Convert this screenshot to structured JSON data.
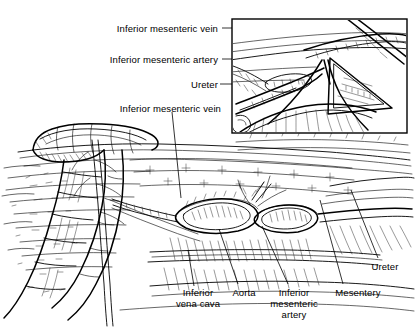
{
  "figure": {
    "style": "pen-and-ink line drawing",
    "background_color": "#ffffff",
    "ink_color": "#000000",
    "width": 416,
    "height": 335
  },
  "inset": {
    "name": "magnified-detail-panel",
    "caption": "",
    "frame_color": "#000000",
    "background_color": "#ffffff",
    "x": 232,
    "y": 19,
    "width": 175,
    "height": 114
  },
  "labels": {
    "inset_group": [
      {
        "id": "inset-imv",
        "text": "Inferior mesenteric vein",
        "x": 218,
        "y": 24,
        "align": "right"
      },
      {
        "id": "inset-ima",
        "text": "Inferior mesenteric artery",
        "x": 218,
        "y": 55,
        "align": "right"
      },
      {
        "id": "inset-ureter",
        "text": "Ureter",
        "x": 218,
        "y": 80,
        "align": "right"
      }
    ],
    "main_group": [
      {
        "id": "main-imv",
        "text": "Inferior mesenteric vein",
        "x": 221,
        "y": 104,
        "align": "right"
      },
      {
        "id": "main-ivc",
        "text": "Inferior\nvena cava",
        "x": 198,
        "y": 288,
        "align": "center"
      },
      {
        "id": "main-aorta",
        "text": "Aorta",
        "x": 244,
        "y": 288,
        "align": "center"
      },
      {
        "id": "main-ima",
        "text": "Inferior\nmesenteric\nartery",
        "x": 294,
        "y": 288,
        "align": "center"
      },
      {
        "id": "main-mesentery",
        "text": "Mesentery",
        "x": 358,
        "y": 288,
        "align": "center"
      },
      {
        "id": "main-ureter",
        "text": "Ureter",
        "x": 385,
        "y": 262,
        "align": "center"
      }
    ]
  },
  "anatomy": {
    "structures": [
      "sigmoid colon",
      "descending colon",
      "mesentery",
      "aorta",
      "inferior vena cava",
      "inferior mesenteric artery",
      "inferior mesenteric vein",
      "ureter",
      "posterior peritoneum"
    ]
  }
}
